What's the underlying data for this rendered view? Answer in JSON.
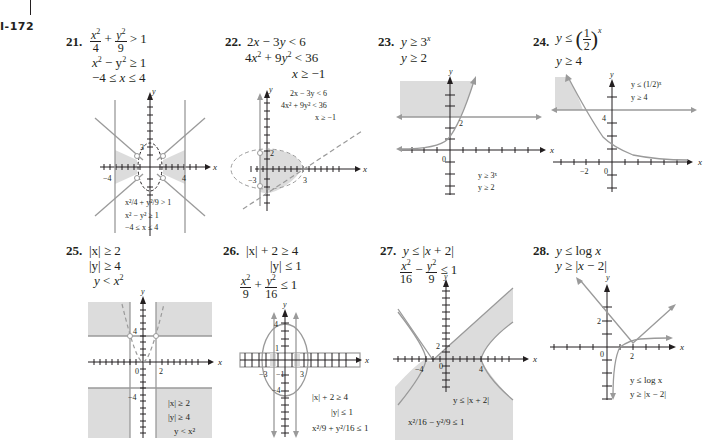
{
  "page": {
    "number": "I-172"
  },
  "problems": [
    {
      "num": "21.",
      "lines": [
        "x²/4 + y²/9 > 1",
        "x² − y² ≥ 1",
        "−4 ≤ x ≤ 4"
      ],
      "graph": {
        "axis_x": "x",
        "axis_y": "y",
        "tick_labels": [
          "3",
          "−4",
          "4"
        ],
        "legend": [
          "x²/4 + y²/9 > 1",
          "x² − y² ≥ 1",
          "−4 ≤ x ≤ 4"
        ]
      }
    },
    {
      "num": "22.",
      "lines": [
        "2x − 3y < 6",
        "4x² + 9y² < 36",
        "x ≥ −1"
      ],
      "graph": {
        "axis_x": "x",
        "axis_y": "y",
        "tick_labels": [
          "2",
          "−3",
          "3"
        ],
        "legend": [
          "2x − 3y < 6",
          "4x² + 9y² < 36",
          "x ≥ −1"
        ]
      }
    },
    {
      "num": "23.",
      "lines": [
        "y ≥ 3ˣ",
        "y ≥ 2"
      ],
      "graph": {
        "axis_x": "x",
        "axis_y": "y",
        "tick_labels": [
          "2",
          "0"
        ],
        "legend": [
          "y ≥ 3ˣ",
          "y ≥ 2"
        ]
      }
    },
    {
      "num": "24.",
      "lines": [
        "y ≤ (1/2)ˣ",
        "y ≥ 4"
      ],
      "graph": {
        "axis_x": "x",
        "axis_y": "y",
        "tick_labels": [
          "4",
          "−2",
          "0"
        ],
        "legend": [
          "y ≤ (1/2)ˣ",
          "y ≥ 4"
        ]
      }
    },
    {
      "num": "25.",
      "lines": [
        "|x| ≥ 2",
        "|y| ≥ 4",
        "y < x²"
      ],
      "graph": {
        "axis_x": "x",
        "axis_y": "y",
        "tick_labels": [
          "4",
          "0",
          "2",
          "−4"
        ],
        "legend": [
          "|x| ≥ 2",
          "|y| ≥ 4",
          "y < x²"
        ]
      }
    },
    {
      "num": "26.",
      "lines": [
        "|x| + 2 ≥ 4",
        "|y| ≤ 1",
        "x²/9 + y²/16 ≤ 1"
      ],
      "graph": {
        "axis_x": "x",
        "axis_y": "y",
        "tick_labels": [
          "4",
          "1",
          "−3",
          "−1",
          "3",
          "−4"
        ],
        "legend": [
          "|x| + 2 ≥ 4",
          "|y| ≤ 1",
          "x²/9 + y²/16 ≤ 1"
        ]
      }
    },
    {
      "num": "27.",
      "lines": [
        "y ≤ |x + 2|",
        "x²/16 − y²/9 ≤ 1"
      ],
      "graph": {
        "axis_x": "x",
        "axis_y": "y",
        "tick_labels": [
          "2",
          "−4",
          "0",
          "4"
        ],
        "legend": [
          "y ≤ |x + 2|",
          "x²/16 − y²/9 ≤ 1"
        ]
      }
    },
    {
      "num": "28.",
      "lines": [
        "y ≤ log x",
        "y ≥ |x − 2|"
      ],
      "graph": {
        "axis_x": "x",
        "axis_y": "y",
        "tick_labels": [
          "2",
          "0",
          "2"
        ],
        "legend": [
          "y ≤ log x",
          "y ≥ |x − 2|"
        ]
      }
    }
  ],
  "text": {
    "p21": {
      "a_num": "x",
      "a_den": "4",
      "b_num": "y",
      "b_den": "9",
      "l1_rel": "> 1",
      "l2": "x",
      "l2b": " − y",
      "l2c": " ≥ 1",
      "l3": "−4 ≤ ",
      "l3x": "x",
      "l3c": " ≤ 4"
    },
    "p22": {
      "l1": "2",
      "l1x": "x",
      "l1m": "  −  3",
      "l1y": "y",
      "l1r": "  < 6",
      "l2": "4",
      "l2x": "x",
      "l2m": "  +  9",
      "l2y": "y",
      "l2r": "  < 36",
      "l3x": "x",
      "l3r": " ≥ −1"
    },
    "p23": {
      "l1y": "y",
      "l1r": " ≥ 3",
      "l1e": "x",
      "l2y": "y",
      "l2r": " ≥ 2"
    },
    "p24": {
      "l1y": "y",
      "l1r": " ≤ ",
      "l1n": "1",
      "l1d": "2",
      "l1e": "x",
      "l2y": "y",
      "l2r": " ≥ 4"
    },
    "p25": {
      "l1": "|x|  ≥  2",
      "l2": "|y|  ≥  4",
      "l3y": "y",
      "l3r": " < ",
      "l3x": "x"
    },
    "p26": {
      "l1": "|x|  +  2  ≥  4",
      "l2": "|y|  ≤  1",
      "fa_num": "x",
      "fa_den": "9",
      "fb_num": "y",
      "fb_den": "16",
      "rel": " ≤ 1"
    },
    "p27": {
      "l1y": "y",
      "l1r": " ≤ |",
      "l1x": "x",
      "l1e": " + 2|",
      "fa_num": "x",
      "fa_den": "16",
      "fb_num": "y",
      "fb_den": "9",
      "rel": " ≤ 1"
    },
    "p28": {
      "l1y": "y",
      "l1r": " ≤ log ",
      "l1x": "x",
      "l2y": "y",
      "l2r": " ≥ |",
      "l2x": "x",
      "l2e": " − 2|"
    }
  },
  "colors": {
    "shade": "#dcdcdc",
    "curve": "#9a9a9a",
    "axis": "#231f20",
    "text": "#231f20"
  }
}
